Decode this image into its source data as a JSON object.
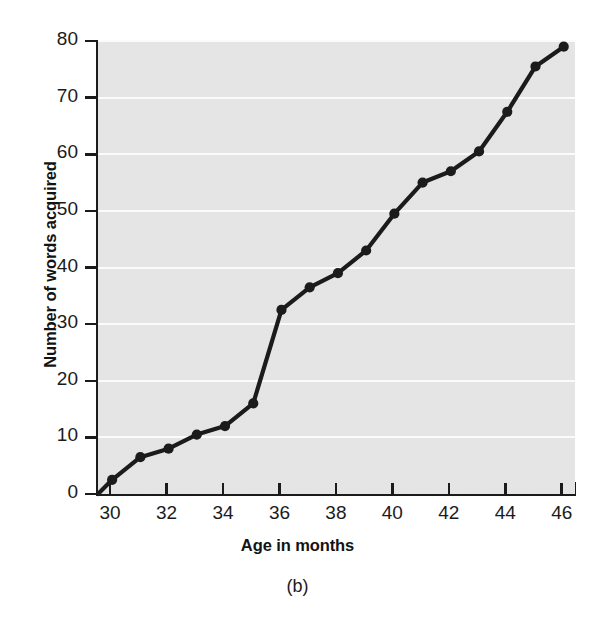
{
  "caption": "(b)",
  "chart_data": {
    "type": "line",
    "title": "",
    "subtitle": "",
    "xlabel": "Age in months",
    "ylabel": "Number of words acquired",
    "xlim": [
      29.5,
      46.4
    ],
    "ylim": [
      0,
      80
    ],
    "grid": true,
    "grid_orientation": "horizontal",
    "grid_color": "#fbfbfb",
    "plot_background": "#e7e7e7",
    "series_color": "#1b1b1b",
    "legend": null,
    "legend_position": "none",
    "marker": "filled-circle",
    "xticks": [
      30,
      32,
      34,
      36,
      38,
      40,
      42,
      44,
      46
    ],
    "xtick_labels": [
      "30",
      "32",
      "34",
      "36",
      "38",
      "40",
      "42",
      "44",
      "46"
    ],
    "yticks": [
      0,
      10,
      20,
      30,
      40,
      50,
      60,
      70,
      80
    ],
    "ytick_labels": [
      "0",
      "10",
      "20",
      "30",
      "40",
      "50",
      "60",
      "70",
      "80"
    ],
    "x": [
      29.5,
      30,
      31,
      32,
      33,
      34,
      35,
      36,
      37,
      38,
      39,
      40,
      41,
      42,
      43,
      44,
      45,
      46
    ],
    "values": [
      0,
      2.5,
      6.5,
      8,
      10.5,
      12,
      16,
      32.5,
      36.5,
      39,
      43,
      49.5,
      55,
      57,
      60.5,
      67.5,
      75.5,
      79
    ],
    "point_markers": [
      false,
      true,
      true,
      true,
      true,
      true,
      true,
      true,
      true,
      true,
      true,
      true,
      true,
      true,
      true,
      true,
      true,
      true
    ],
    "series": [
      {
        "name": "Words acquired",
        "x": [
          29.5,
          30,
          31,
          32,
          33,
          34,
          35,
          36,
          37,
          38,
          39,
          40,
          41,
          42,
          43,
          44,
          45,
          46
        ],
        "values": [
          0,
          2.5,
          6.5,
          8,
          10.5,
          12,
          16,
          32.5,
          36.5,
          39,
          43,
          49.5,
          55,
          57,
          60.5,
          67.5,
          75.5,
          79
        ]
      }
    ]
  }
}
